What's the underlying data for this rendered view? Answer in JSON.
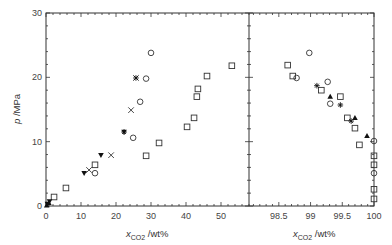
{
  "chart_data": {
    "type": "scatter",
    "title": "",
    "ylabel": "p /MPa",
    "xlabel": "x_CO2 /wt%",
    "xlabel_main": "x",
    "xlabel_sub": "CO2",
    "xlabel_unit": "/wt%",
    "ylim": [
      0,
      30
    ],
    "yticks": [
      0,
      10,
      20,
      30
    ],
    "grid": false,
    "legend": null,
    "panels": [
      {
        "name": "left",
        "xlim": [
          0,
          58
        ],
        "xticks": [
          0,
          10,
          20,
          30,
          40,
          50
        ],
        "px_x0": 46,
        "px_x1": 249
      },
      {
        "name": "right",
        "xlim": [
          98.03,
          100
        ],
        "xticks": [
          98.5,
          99,
          99.5,
          100
        ],
        "px_x0": 249,
        "px_x1": 374
      }
    ],
    "series": [
      {
        "name": "open-square",
        "marker": "square",
        "points": [
          [
            2.3,
            1.4
          ],
          [
            5.7,
            2.8
          ],
          [
            14.0,
            6.4
          ],
          [
            28.6,
            7.8
          ],
          [
            32.3,
            9.8
          ],
          [
            40.3,
            12.3
          ],
          [
            42.3,
            13.7
          ],
          [
            43.1,
            17.0
          ],
          [
            43.4,
            18.2
          ],
          [
            46.0,
            20.2
          ],
          [
            53.1,
            21.8
          ],
          [
            98.64,
            21.9
          ],
          [
            98.72,
            20.2
          ],
          [
            99.17,
            18.0
          ],
          [
            99.47,
            17.0
          ],
          [
            99.58,
            13.7
          ],
          [
            99.7,
            12.1
          ],
          [
            99.77,
            9.5
          ],
          [
            100,
            7.8
          ],
          [
            100,
            6.4
          ],
          [
            100,
            2.6
          ],
          [
            100,
            1.1
          ]
        ]
      },
      {
        "name": "open-circle",
        "marker": "circle",
        "points": [
          [
            14.0,
            5.1
          ],
          [
            24.9,
            10.6
          ],
          [
            26.9,
            16.2
          ],
          [
            28.6,
            19.8
          ],
          [
            30.0,
            23.8
          ],
          [
            98.98,
            23.8
          ],
          [
            98.78,
            19.9
          ],
          [
            99.27,
            19.3
          ],
          [
            99.31,
            15.9
          ],
          [
            100,
            10.1
          ],
          [
            100,
            5.1
          ]
        ]
      },
      {
        "name": "cross",
        "marker": "x",
        "points": [
          [
            12.3,
            5.6
          ],
          [
            18.6,
            7.9
          ],
          [
            24.3,
            14.9
          ],
          [
            25.7,
            19.9
          ]
        ]
      },
      {
        "name": "filled-triangle-down",
        "marker": "triangle-down",
        "points": [
          [
            0.4,
            0.3
          ],
          [
            1.0,
            0.7
          ],
          [
            10.9,
            5.1
          ],
          [
            15.7,
            7.9
          ],
          [
            22.3,
            11.5
          ]
        ]
      },
      {
        "name": "filled-triangle-up",
        "marker": "triangle-up",
        "points": [
          [
            0.2,
            0.1
          ],
          [
            0.8,
            0.5
          ],
          [
            99.31,
            17.0
          ],
          [
            99.7,
            13.7
          ],
          [
            99.89,
            10.9
          ]
        ]
      },
      {
        "name": "asterisk",
        "marker": "asterisk",
        "points": [
          [
            22.3,
            11.5
          ],
          [
            25.7,
            19.9
          ],
          [
            99.1,
            18.7
          ],
          [
            99.47,
            15.7
          ],
          [
            99.64,
            13.2
          ]
        ]
      }
    ]
  }
}
